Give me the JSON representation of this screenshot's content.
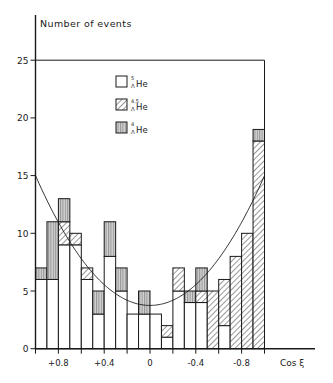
{
  "chart_data": {
    "type": "bar",
    "subtype": "stacked-histogram",
    "title": "",
    "xlabel": "Cos ξ",
    "ylabel": "Number of events",
    "ylim": [
      0,
      25
    ],
    "xlim": [
      1.0,
      -1.0
    ],
    "grid": false,
    "legend_position": "upper-left-inside",
    "x_ticks": [
      1.0,
      0.8,
      0.6,
      0.4,
      0.2,
      0.0,
      -0.2,
      -0.4,
      -0.6,
      -0.8,
      -1.0
    ],
    "x_tick_labels": [
      {
        "value": 0.8,
        "label": "+0.8"
      },
      {
        "value": 0.4,
        "label": "+0.4"
      },
      {
        "value": 0.0,
        "label": "0"
      },
      {
        "value": -0.4,
        "label": "-0.4"
      },
      {
        "value": -0.8,
        "label": "-0.8"
      }
    ],
    "y_ticks": [
      0,
      5,
      10,
      15,
      20,
      25
    ],
    "y_tick_labels": [
      "0",
      "5",
      "10",
      "15",
      "20",
      "25"
    ],
    "bin_width": 0.1,
    "categories": [
      "1.0 to 0.9",
      "0.9 to 0.8",
      "0.8 to 0.7",
      "0.7 to 0.6",
      "0.6 to 0.5",
      "0.5 to 0.4",
      "0.4 to 0.3",
      "0.3 to 0.2",
      "0.2 to 0.1",
      "0.1 to 0.0",
      "0.0 to -0.1",
      "-0.1 to -0.2",
      "-0.2 to -0.3",
      "-0.3 to -0.4",
      "-0.4 to -0.5",
      "-0.5 to -0.6",
      "-0.6 to -0.7",
      "-0.7 to -0.8",
      "-0.8 to -0.9",
      "-0.9 to -1.0"
    ],
    "series": [
      {
        "name": "5_ΛHe",
        "label_sup": "5",
        "label_sub": "Λ",
        "label_main": "He",
        "fill": "open",
        "values": [
          6,
          6,
          9,
          9,
          6,
          3,
          8,
          5,
          3,
          3,
          3,
          1,
          5,
          4,
          4,
          0,
          2,
          0,
          0,
          0
        ]
      },
      {
        "name": "4,5_ΛHe",
        "label_sup": "4,5",
        "label_sub": "Λ",
        "label_main": "He",
        "fill": "diagonal-hatch",
        "values": [
          0,
          0,
          2,
          1,
          1,
          0,
          0,
          0,
          0,
          0,
          0,
          1,
          2,
          0,
          1,
          5,
          4,
          8,
          10,
          18
        ]
      },
      {
        "name": "4_ΛHe",
        "label_sup": "4",
        "label_sub": "Λ",
        "label_main": "He",
        "fill": "vertical-stripes",
        "values": [
          1,
          5,
          2,
          0,
          0,
          2,
          3,
          2,
          0,
          2,
          0,
          0,
          0,
          1,
          2,
          0,
          0,
          0,
          0,
          1
        ]
      }
    ],
    "totals": [
      7,
      11,
      13,
      10,
      7,
      5,
      11,
      7,
      3,
      5,
      3,
      2,
      7,
      5,
      7,
      5,
      6,
      8,
      10,
      19
    ],
    "fit_curve": {
      "form": "a + b*cos^2",
      "a": 3.75,
      "b": 11.25,
      "value_at_cos_1": 15,
      "value_at_cos_0": 3.75
    },
    "frame_top": 25
  },
  "colors": {
    "ink": "#1a1a1a",
    "stripe_fill": "#c9c9c9",
    "background": "#ffffff"
  }
}
